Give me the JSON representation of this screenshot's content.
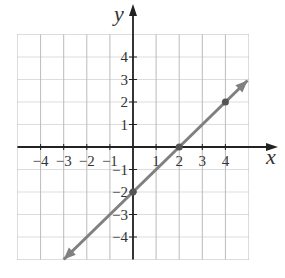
{
  "chart_data": {
    "type": "line",
    "title": "",
    "xlabel": "x",
    "ylabel": "y",
    "xlim": [
      -5,
      5
    ],
    "ylim": [
      -5,
      5
    ],
    "grid": true,
    "x_ticks": [
      -4,
      -3,
      -2,
      -1,
      1,
      2,
      3,
      4
    ],
    "y_ticks": [
      4,
      3,
      2,
      1,
      -1,
      -2,
      -3,
      -4
    ],
    "x_tick_labels": [
      "−4",
      "−3",
      "−2",
      "−1",
      "1",
      "2",
      "3",
      "4"
    ],
    "y_tick_labels": [
      "4",
      "3",
      "2",
      "1",
      "−1",
      "−2",
      "−3",
      "−4"
    ],
    "series": [
      {
        "name": "line",
        "equation": "y = x - 2",
        "x": [
          -3,
          5
        ],
        "y": [
          -5,
          3
        ],
        "arrows": "both",
        "color": "#808080"
      }
    ],
    "points": [
      {
        "x": 0,
        "y": -2
      },
      {
        "x": 2,
        "y": 0
      },
      {
        "x": 4,
        "y": 2
      }
    ]
  }
}
